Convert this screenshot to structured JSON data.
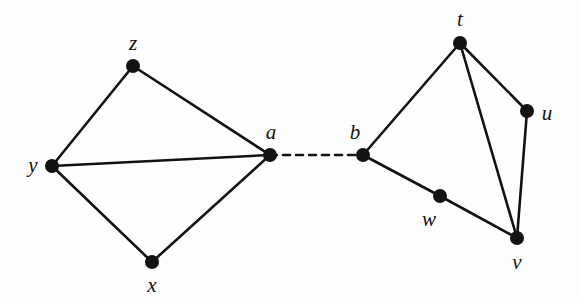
{
  "figure": {
    "background_color": "#fefefe",
    "ink_color": "#121212",
    "width": 580,
    "height": 302
  },
  "graph": {
    "vertex_radius": 7,
    "edge_width": 2.6,
    "dashed_edge_width": 2.6,
    "dash_pattern": "7,6",
    "vertices": [
      {
        "id": "z",
        "label": "z",
        "cx": 133,
        "cy": 66,
        "label_x": 133,
        "label_y": 43,
        "component": "left"
      },
      {
        "id": "y",
        "label": "y",
        "cx": 52,
        "cy": 166,
        "label_x": 33,
        "label_y": 165,
        "component": "left"
      },
      {
        "id": "a",
        "label": "a",
        "cx": 270,
        "cy": 155,
        "label_x": 271,
        "label_y": 132,
        "component": "left"
      },
      {
        "id": "x",
        "label": "x",
        "cx": 152,
        "cy": 262,
        "label_x": 152,
        "label_y": 285,
        "component": "left"
      },
      {
        "id": "b",
        "label": "b",
        "cx": 363,
        "cy": 155,
        "label_x": 355,
        "label_y": 132,
        "component": "right"
      },
      {
        "id": "t",
        "label": "t",
        "cx": 460,
        "cy": 43,
        "label_x": 460,
        "label_y": 19,
        "component": "right"
      },
      {
        "id": "u",
        "label": "u",
        "cx": 527,
        "cy": 111,
        "label_x": 547,
        "label_y": 113,
        "component": "right"
      },
      {
        "id": "w",
        "label": "w",
        "cx": 440,
        "cy": 196,
        "label_x": 429,
        "label_y": 219,
        "component": "right"
      },
      {
        "id": "v",
        "label": "v",
        "cx": 517,
        "cy": 238,
        "label_x": 517,
        "label_y": 262,
        "component": "right"
      }
    ],
    "edges": [
      {
        "id": "y-z",
        "from": "y",
        "to": "z",
        "style": "solid"
      },
      {
        "id": "z-a",
        "from": "z",
        "to": "a",
        "style": "solid"
      },
      {
        "id": "y-a",
        "from": "y",
        "to": "a",
        "style": "solid"
      },
      {
        "id": "y-x",
        "from": "y",
        "to": "x",
        "style": "solid"
      },
      {
        "id": "x-a",
        "from": "x",
        "to": "a",
        "style": "solid"
      },
      {
        "id": "a-b",
        "from": "a",
        "to": "b",
        "style": "dashed"
      },
      {
        "id": "b-t",
        "from": "b",
        "to": "t",
        "style": "solid"
      },
      {
        "id": "b-w",
        "from": "b",
        "to": "w",
        "style": "solid"
      },
      {
        "id": "w-v",
        "from": "w",
        "to": "v",
        "style": "solid"
      },
      {
        "id": "t-u",
        "from": "t",
        "to": "u",
        "style": "solid"
      },
      {
        "id": "t-v",
        "from": "t",
        "to": "v",
        "style": "solid"
      },
      {
        "id": "u-v",
        "from": "u",
        "to": "v",
        "style": "solid"
      }
    ]
  }
}
